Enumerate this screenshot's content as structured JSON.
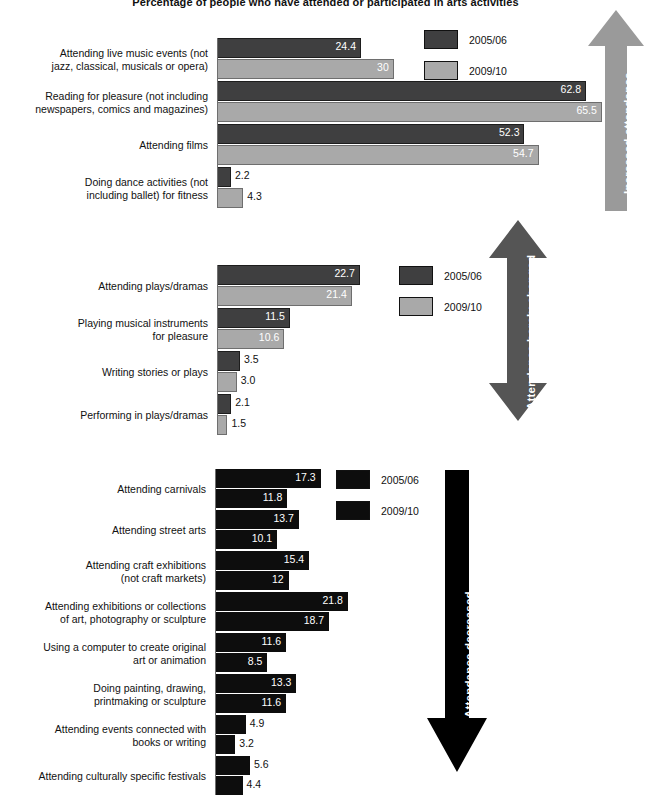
{
  "title": "Percentage of people who have attended or participated in arts activities",
  "colors": {
    "series_2005_dark": "#3f3f40",
    "series_2009_light": "#a9a9a9",
    "series_black": "#0d0d0d",
    "arrow_increased": "#9a9a9a",
    "arrow_unchanged": "#555555",
    "arrow_decreased": "#000000",
    "background": "#ffffff"
  },
  "legend_labels": {
    "series1": "2005/06",
    "series2": "2009/10"
  },
  "arrows": {
    "increased": "Increased attendance",
    "unchanged": "Attendance barely changed",
    "decreased": "Attendance decreased"
  },
  "chart_data": [
    {
      "type": "bar",
      "title": "Increased attendance",
      "orientation": "horizontal",
      "xlabel": "",
      "ylabel": "",
      "xlim": [
        0,
        66
      ],
      "grid": false,
      "legend_position": "top-right",
      "categories": [
        "Attending live music events (not\njazz, classical, musicals or opera)",
        "Reading for pleasure (not including\nnewspapers, comics and magazines)",
        "Attending films",
        "Doing dance activities (not\nincluding ballet) for fitness"
      ],
      "series": [
        {
          "name": "2005/06",
          "values": [
            24.4,
            62.8,
            52.3,
            2.2
          ],
          "labels": [
            "24.4",
            "62.8",
            "52.3",
            "2.2"
          ]
        },
        {
          "name": "2009/10",
          "values": [
            30,
            65.5,
            54.7,
            4.3
          ],
          "labels": [
            "30",
            "65.5",
            "54.7",
            "4.3"
          ]
        }
      ]
    },
    {
      "type": "bar",
      "title": "Attendance barely changed",
      "orientation": "horizontal",
      "xlabel": "",
      "ylabel": "",
      "xlim": [
        0,
        23
      ],
      "grid": false,
      "legend_position": "top-right",
      "categories": [
        "Attending plays/dramas",
        "Playing musical instruments\nfor pleasure",
        "Writing stories or plays",
        "Performing in plays/dramas"
      ],
      "series": [
        {
          "name": "2005/06",
          "values": [
            22.7,
            11.5,
            3.5,
            2.1
          ],
          "labels": [
            "22.7",
            "11.5",
            "3.5",
            "2.1"
          ]
        },
        {
          "name": "2009/10",
          "values": [
            21.4,
            10.6,
            3.0,
            1.5
          ],
          "labels": [
            "21.4",
            "10.6",
            "3.0",
            "1.5"
          ]
        }
      ]
    },
    {
      "type": "bar",
      "title": "Attendance decreased",
      "orientation": "horizontal",
      "xlabel": "",
      "ylabel": "",
      "xlim": [
        0,
        22
      ],
      "grid": false,
      "legend_position": "top-right",
      "categories": [
        "Attending carnivals",
        "Attending street arts",
        "Attending craft exhibitions\n(not craft markets)",
        "Attending exhibitions or collections\nof art, photography or sculpture",
        "Using a computer to create original\nart or animation",
        "Doing painting, drawing,\nprintmaking or sculpture",
        "Attending events connected with\nbooks or writing",
        "Attending culturally specific festivals"
      ],
      "series": [
        {
          "name": "2005/06",
          "values": [
            17.3,
            13.7,
            15.4,
            21.8,
            11.6,
            13.3,
            4.9,
            5.6
          ],
          "labels": [
            "17.3",
            "13.7",
            "15.4",
            "21.8",
            "11.6",
            "13.3",
            "4.9",
            "5.6"
          ]
        },
        {
          "name": "2009/10",
          "values": [
            11.8,
            10.1,
            12,
            18.7,
            8.5,
            11.6,
            3.2,
            4.4
          ],
          "labels": [
            "11.8",
            "10.1",
            "12",
            "18.7",
            "8.5",
            "11.6",
            "3.2",
            "4.4"
          ]
        }
      ]
    }
  ]
}
